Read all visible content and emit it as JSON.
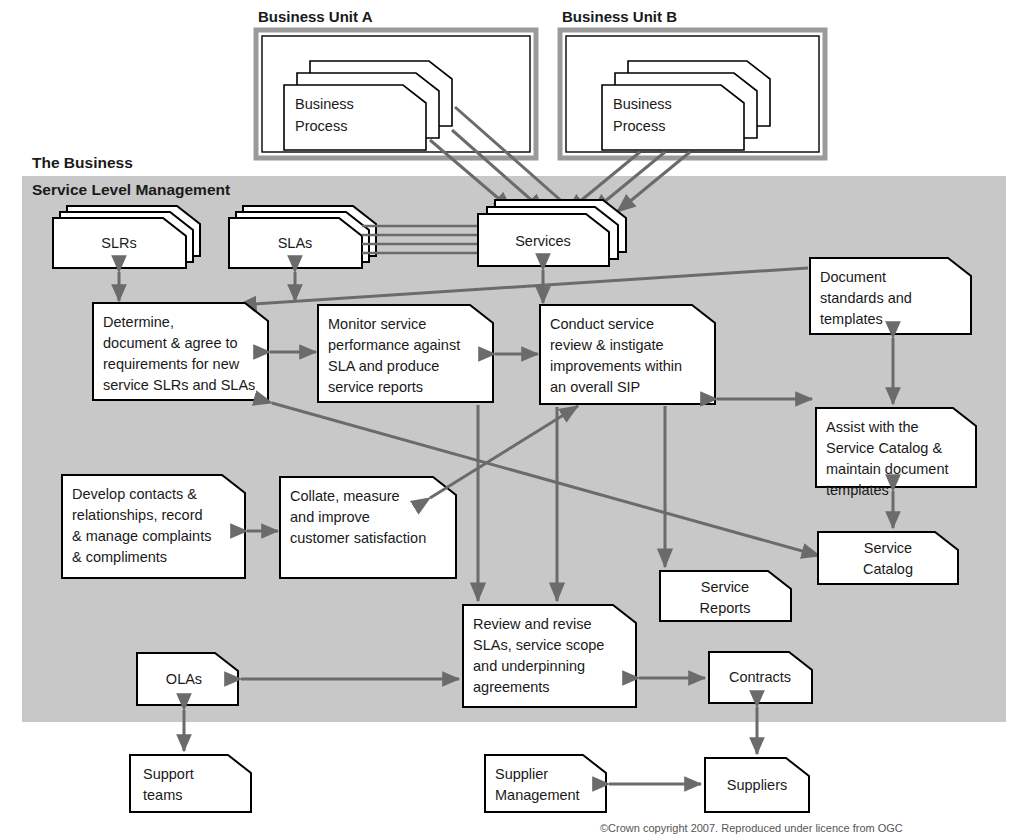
{
  "regions": {
    "business_unit_a": {
      "label": "Business Unit A"
    },
    "business_unit_b": {
      "label": "Business Unit B"
    },
    "the_business": {
      "label": "The Business"
    },
    "service_level_management": {
      "label": "Service Level Management"
    }
  },
  "colors": {
    "slm_background": "#c8c8c8",
    "node_fill": "#ffffff",
    "node_stroke": "#000000",
    "connector": "#6b6b6b",
    "unit_frame": "#9a9a9a"
  },
  "nodes": {
    "business_process_a": {
      "label": "Business\nProcess",
      "lines": [
        "Business",
        "Process"
      ]
    },
    "business_process_b": {
      "label": "Business\nProcess",
      "lines": [
        "Business",
        "Process"
      ]
    },
    "slrs": {
      "label": "SLRs",
      "lines": [
        "SLRs"
      ]
    },
    "slas": {
      "label": "SLAs",
      "lines": [
        "SLAs"
      ]
    },
    "services": {
      "label": "Services",
      "lines": [
        "Services"
      ]
    },
    "determine_document_agree": {
      "label": "Determine, document & agree to requirements for new service SLRs and SLAs",
      "lines": [
        "Determine,",
        "document & agree to",
        "requirements for new",
        "service SLRs and SLAs"
      ]
    },
    "monitor_service_performance": {
      "label": "Monitor service performance against SLA and produce service reports",
      "lines": [
        "Monitor service",
        "performance against",
        "SLA and produce",
        "service reports"
      ]
    },
    "conduct_service_review": {
      "label": "Conduct service review & instigate improvements within an overall SIP",
      "lines": [
        "Conduct service",
        "review & instigate",
        "improvements within",
        "an overall SIP"
      ]
    },
    "document_standards": {
      "label": "Document standards and templates",
      "lines": [
        "Document",
        "standards and",
        "templates"
      ]
    },
    "assist_service_catalog": {
      "label": "Assist with the Service Catalog & maintain document templates",
      "lines": [
        "Assist with the",
        "Service Catalog &",
        "maintain document",
        "templates"
      ]
    },
    "develop_contacts": {
      "label": "Develop contacts & relationships, record & manage complaints & compliments",
      "lines": [
        "Develop contacts &",
        "relationships, record",
        "& manage complaints",
        "& compliments"
      ]
    },
    "collate_measure": {
      "label": "Collate, measure and improve customer satisfaction",
      "lines": [
        "Collate, measure",
        "and improve",
        "customer satisfaction"
      ]
    },
    "service_catalog": {
      "label": "Service Catalog",
      "lines": [
        "Service",
        "Catalog"
      ]
    },
    "service_reports": {
      "label": "Service Reports",
      "lines": [
        "Service",
        "Reports"
      ]
    },
    "review_revise_slas": {
      "label": "Review and revise SLAs, service scope and underpinning agreements",
      "lines": [
        "Review and revise",
        "SLAs, service scope",
        "and underpinning",
        "agreements"
      ]
    },
    "olas": {
      "label": "OLAs",
      "lines": [
        "OLAs"
      ]
    },
    "contracts": {
      "label": "Contracts",
      "lines": [
        "Contracts"
      ]
    },
    "support_teams": {
      "label": "Support teams",
      "lines": [
        "Support",
        "teams"
      ]
    },
    "supplier_management": {
      "label": "Supplier Management",
      "lines": [
        "Supplier",
        "Management"
      ]
    },
    "suppliers": {
      "label": "Suppliers",
      "lines": [
        "Suppliers"
      ]
    }
  },
  "connections": [
    {
      "from": "business_process_a",
      "to": "services",
      "arrow": "single"
    },
    {
      "from": "business_process_b",
      "to": "services",
      "arrow": "single"
    },
    {
      "from": "slrs",
      "to": "determine_document_agree",
      "arrow": "double"
    },
    {
      "from": "slas",
      "to": "monitor_service_performance",
      "arrow": "double"
    },
    {
      "from": "slas",
      "to": "services",
      "arrow": "none"
    },
    {
      "from": "services",
      "to": "conduct_service_review",
      "arrow": "double"
    },
    {
      "from": "determine_document_agree",
      "to": "monitor_service_performance",
      "arrow": "double"
    },
    {
      "from": "monitor_service_performance",
      "to": "conduct_service_review",
      "arrow": "double"
    },
    {
      "from": "document_standards",
      "to": "determine_document_agree",
      "arrow": "single"
    },
    {
      "from": "document_standards",
      "to": "assist_service_catalog",
      "arrow": "double"
    },
    {
      "from": "conduct_service_review",
      "to": "assist_service_catalog",
      "arrow": "double"
    },
    {
      "from": "assist_service_catalog",
      "to": "service_catalog",
      "arrow": "double"
    },
    {
      "from": "develop_contacts",
      "to": "collate_measure",
      "arrow": "double"
    },
    {
      "from": "collate_measure",
      "to": "conduct_service_review",
      "arrow": "double"
    },
    {
      "from": "determine_document_agree",
      "to": "service_catalog",
      "arrow": "double"
    },
    {
      "from": "conduct_service_review",
      "to": "review_revise_slas",
      "arrow": "double"
    },
    {
      "from": "monitor_service_performance",
      "to": "review_revise_slas",
      "arrow": "double"
    },
    {
      "from": "monitor_service_performance",
      "to": "service_reports",
      "arrow": "single"
    },
    {
      "from": "olas",
      "to": "review_revise_slas",
      "arrow": "double"
    },
    {
      "from": "review_revise_slas",
      "to": "contracts",
      "arrow": "double"
    },
    {
      "from": "olas",
      "to": "support_teams",
      "arrow": "double"
    },
    {
      "from": "contracts",
      "to": "suppliers",
      "arrow": "double"
    },
    {
      "from": "supplier_management",
      "to": "suppliers",
      "arrow": "double"
    }
  ],
  "footer": {
    "copyright": "©Crown copyright 2007. Reproduced under licence from OGC"
  }
}
